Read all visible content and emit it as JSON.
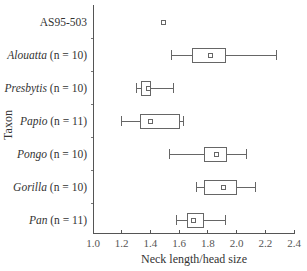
{
  "chart_data": {
    "type": "boxplot",
    "title": "",
    "xlabel": "Neck length/head size",
    "ylabel": "Taxon",
    "xlim": [
      1.0,
      2.4
    ],
    "xticks": [
      "1.0",
      "1.2",
      "1.4",
      "1.6",
      "1.8",
      "2.0",
      "2.2",
      "2.4"
    ],
    "xtick_values": [
      1.0,
      1.2,
      1.4,
      1.6,
      1.8,
      2.0,
      2.2,
      2.4
    ],
    "grid": false,
    "legend": "none",
    "categories": [
      {
        "name": "AS95-503",
        "italic": false,
        "n_label": ""
      },
      {
        "name": "Alouatta",
        "italic": true,
        "n_label": " (n = 10)"
      },
      {
        "name": "Presbytis",
        "italic": true,
        "n_label": " (n = 10)"
      },
      {
        "name": "Papio",
        "italic": true,
        "n_label": " (n = 11)"
      },
      {
        "name": "Pongo",
        "italic": true,
        "n_label": " (n = 10)"
      },
      {
        "name": "Gorilla",
        "italic": true,
        "n_label": " (n = 10)"
      },
      {
        "name": "Pan",
        "italic": true,
        "n_label": " (n = 11)"
      }
    ],
    "series": [
      {
        "name": "AS95-503",
        "type": "point",
        "value": 1.49
      },
      {
        "name": "Alouatta",
        "whisker_low": 1.55,
        "box_low": 1.69,
        "mean": 1.82,
        "box_high": 1.92,
        "whisker_high": 2.28
      },
      {
        "name": "Presbytis",
        "whisker_low": 1.3,
        "box_low": 1.34,
        "mean": 1.39,
        "box_high": 1.4,
        "whisker_high": 1.56
      },
      {
        "name": "Papio",
        "whisker_low": 1.2,
        "box_low": 1.33,
        "mean": 1.4,
        "box_high": 1.6,
        "whisker_high": 1.63
      },
      {
        "name": "Pongo",
        "whisker_low": 1.53,
        "box_low": 1.78,
        "mean": 1.86,
        "box_high": 1.93,
        "whisker_high": 2.07
      },
      {
        "name": "Gorilla",
        "whisker_low": 1.72,
        "box_low": 1.78,
        "mean": 1.91,
        "box_high": 2.0,
        "whisker_high": 2.13
      },
      {
        "name": "Pan",
        "whisker_low": 1.58,
        "box_low": 1.66,
        "mean": 1.7,
        "box_high": 1.77,
        "whisker_high": 1.92
      }
    ]
  }
}
